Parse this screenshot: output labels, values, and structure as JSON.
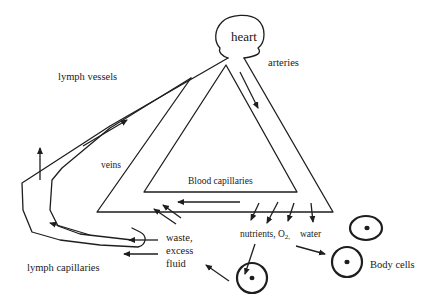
{
  "diagram": {
    "title": "",
    "labels": {
      "heart": "heart",
      "arteries": "arteries",
      "lymph_vessels": "lymph vessels",
      "veins": "veins",
      "blood_capillaries": "Blood capillaries",
      "waste_line1": "waste,",
      "waste_line2": "excess",
      "waste_line3": "fluid",
      "nutrients": "nutrients, O",
      "o2_subscript": "2,",
      "water": "water",
      "lymph_capillaries": "lymph capillaries",
      "body_cells": "Body cells"
    },
    "nodes": [
      {
        "id": "heart",
        "label": "heart"
      },
      {
        "id": "arteries",
        "label": "arteries"
      },
      {
        "id": "blood_capillaries",
        "label": "Blood capillaries"
      },
      {
        "id": "veins",
        "label": "veins"
      },
      {
        "id": "lymph_capillaries",
        "label": "lymph capillaries"
      },
      {
        "id": "lymph_vessels",
        "label": "lymph vessels"
      },
      {
        "id": "body_cells",
        "label": "Body cells"
      }
    ],
    "flows": [
      {
        "from": "heart",
        "to": "arteries"
      },
      {
        "from": "arteries",
        "to": "blood_capillaries"
      },
      {
        "from": "blood_capillaries",
        "to": "body_cells",
        "carries": "nutrients, O2, water"
      },
      {
        "from": "body_cells",
        "to": "veins",
        "carries": "waste"
      },
      {
        "from": "body_cells",
        "to": "lymph_capillaries",
        "carries": "excess fluid"
      },
      {
        "from": "blood_capillaries",
        "to": "veins"
      },
      {
        "from": "lymph_capillaries",
        "to": "lymph_vessels"
      },
      {
        "from": "lymph_vessels",
        "to": "heart"
      }
    ],
    "colors": {
      "ink": "#1e1e1e",
      "background": "#ffffff"
    }
  }
}
